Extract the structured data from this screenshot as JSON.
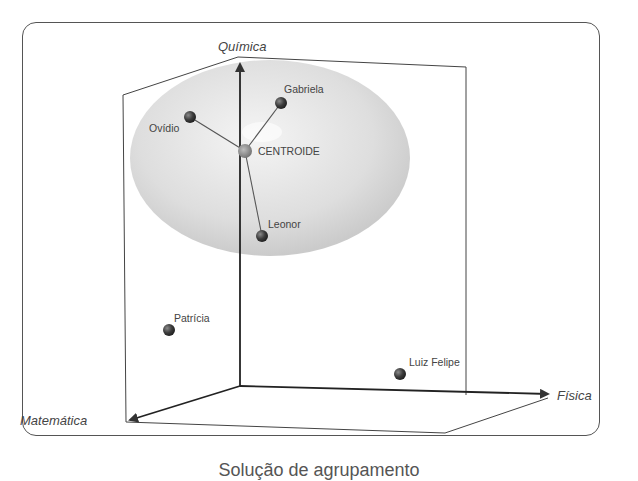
{
  "diagram": {
    "type": "3d-cluster-scatter",
    "axes": {
      "vertical": "Química",
      "right": "Física",
      "front_left": "Matemática"
    },
    "cluster": {
      "centroid_label": "CENTROIDE",
      "members": [
        "Ovídio",
        "Gabriela",
        "Leonor"
      ]
    },
    "points": [
      {
        "name": "Gabriela",
        "x": 281,
        "y": 103,
        "in_cluster": true
      },
      {
        "name": "Ovídio",
        "x": 190,
        "y": 117,
        "in_cluster": true
      },
      {
        "name": "CENTROIDE",
        "x": 245,
        "y": 151,
        "centroid": true
      },
      {
        "name": "Leonor",
        "x": 262,
        "y": 236,
        "in_cluster": true
      },
      {
        "name": "Patrícia",
        "x": 169,
        "y": 330,
        "in_cluster": false
      },
      {
        "name": "Luiz Felipe",
        "x": 400,
        "y": 374,
        "in_cluster": false
      }
    ],
    "labels": {
      "gabriela": "Gabriela",
      "ovidio": "Ovídio",
      "centroide": "CENTROIDE",
      "leonor": "Leonor",
      "patricia": "Patrícia",
      "luiz_felipe": "Luiz Felipe"
    },
    "caption": "Solução de agrupamento"
  }
}
